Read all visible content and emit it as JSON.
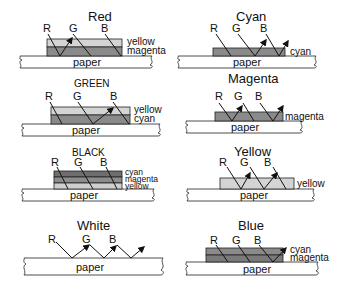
{
  "colors": {
    "yellow_layer": "#d4d4d4",
    "magenta_layer": "#8a8a8a",
    "cyan_layer": "#7a7a7a",
    "black_cyan_layer": "#6e6e6e",
    "black_magenta_layer": "#8c8c8c",
    "black_yellow_layer": "#cfcfcf",
    "paper": "#ffffff",
    "ink": "#111111"
  },
  "rays": {
    "r": "R",
    "g": "G",
    "b": "B"
  },
  "paper_label": "paper",
  "panels": [
    {
      "id": "red",
      "title": "Red",
      "layers": [
        "yellow",
        "magenta"
      ],
      "reflected": [
        "R"
      ]
    },
    {
      "id": "cyan",
      "title": "Cyan",
      "layers": [
        "cyan"
      ],
      "reflected": [
        "G",
        "B"
      ]
    },
    {
      "id": "green",
      "title": "GREEN",
      "layers": [
        "yellow",
        "cyan"
      ],
      "reflected": [
        "G"
      ]
    },
    {
      "id": "magenta",
      "title": "Magenta",
      "layers": [
        "magenta"
      ],
      "reflected": [
        "R",
        "B"
      ]
    },
    {
      "id": "black",
      "title": "BLACK",
      "layers": [
        "cyan",
        "magenta",
        "yellow"
      ],
      "reflected": []
    },
    {
      "id": "yellow",
      "title": "Yellow",
      "layers": [
        "yellow"
      ],
      "reflected": [
        "R",
        "G"
      ]
    },
    {
      "id": "white",
      "title": "White",
      "layers": [],
      "reflected": [
        "R",
        "G",
        "B"
      ]
    },
    {
      "id": "blue",
      "title": "Blue",
      "layers": [
        "cyan",
        "magenta"
      ],
      "reflected": [
        "B"
      ]
    }
  ]
}
